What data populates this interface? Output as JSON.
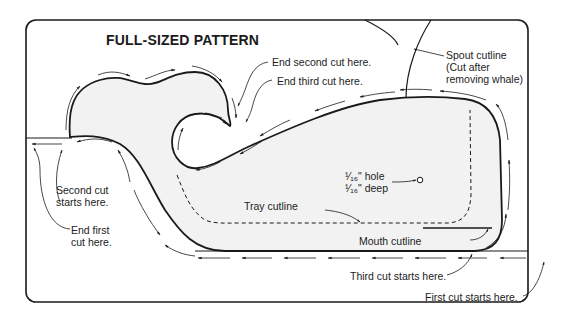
{
  "title": "FULL-SIZED PATTERN",
  "colors": {
    "line": "#1a1a1a",
    "whale_fill": "#f2f2f2",
    "background": "#ffffff",
    "label": "#222222"
  },
  "labels": {
    "end_second_cut": "End second  cut here.",
    "end_third_cut": "End third  cut here.",
    "spout_cutline_1": "Spout cutline",
    "spout_cutline_2": "(Cut after",
    "spout_cutline_3": "removing whale)",
    "second_cut_starts_1": "Second cut",
    "second_cut_starts_2": "starts here.",
    "end_first_cut_1": "End first",
    "end_first_cut_2": "cut here.",
    "hole_1": "¹⁄₁₆\" hole",
    "hole_2": "¹⁄₁₆\" deep",
    "tray_cutline": "Tray cutline",
    "mouth_cutline": "Mouth cutline",
    "third_cut_starts": "Third cut  starts here.",
    "first_cut_starts": "First cut  starts here."
  },
  "icons": {
    "cut_direction": "arrow-icon",
    "hole_marker": "circle-icon"
  }
}
